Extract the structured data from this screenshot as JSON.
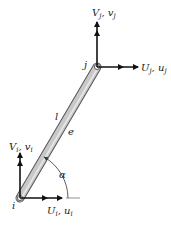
{
  "diagram": {
    "type": "truss-element-free-body",
    "element": {
      "label_length": "l",
      "label_element": "e",
      "fill_color": "#c8c8c8",
      "edge_color": "#555555"
    },
    "nodes": {
      "i": {
        "label": "i"
      },
      "j": {
        "label": "j"
      }
    },
    "forces": {
      "Vj": {
        "main": "V",
        "sub": "j",
        "sep": ", ",
        "disp": "v",
        "disp_sub": "j"
      },
      "Uj": {
        "main": "U",
        "sub": "j",
        "sep": ", ",
        "disp": "u",
        "disp_sub": "j"
      },
      "Vi": {
        "main": "V",
        "sub": "i",
        "sep": ", ",
        "disp": "v",
        "disp_sub": "i"
      },
      "Ui": {
        "main": "U",
        "sub": "i",
        "sep": ", ",
        "disp": "u",
        "disp_sub": "i"
      }
    },
    "angle": {
      "label": "α"
    },
    "arrow_color": "#111111"
  }
}
